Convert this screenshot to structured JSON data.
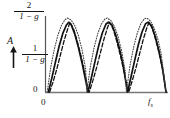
{
  "chart_data": {
    "type": "line",
    "title": "",
    "xlabel": "f",
    "ylabel": "A",
    "xlim": [
      0,
      1
    ],
    "ylim": [
      0,
      2
    ],
    "grid": false,
    "legend": "none",
    "x_tick_labels": [
      "0",
      "fs"
    ],
    "x_tick_values": [
      0,
      1
    ],
    "y_tick_labels": [
      "0",
      "1/(1-g)",
      "2/(1-g)"
    ],
    "y_tick_values": [
      0,
      1,
      2
    ],
    "annotations": [
      "A"
    ],
    "series": [
      {
        "name": "solid",
        "style": "solid",
        "color": "#111111",
        "peaks_x": [
          0.19,
          0.52,
          0.85
        ],
        "peak_value": 2.0,
        "zeros_x": [
          0.02,
          0.35,
          0.68,
          1.0
        ],
        "x": [
          0.02,
          0.05,
          0.08,
          0.11,
          0.14,
          0.17,
          0.19,
          0.21,
          0.24,
          0.27,
          0.3,
          0.33,
          0.35,
          0.38,
          0.41,
          0.44,
          0.47,
          0.5,
          0.52,
          0.55,
          0.58,
          0.61,
          0.64,
          0.67,
          0.68,
          0.71,
          0.74,
          0.77,
          0.8,
          0.83,
          0.85,
          0.88,
          0.91,
          0.94,
          0.97,
          1.0
        ],
        "y": [
          0.0,
          0.42,
          0.88,
          1.32,
          1.68,
          1.92,
          2.0,
          1.93,
          1.66,
          1.28,
          0.84,
          0.34,
          0.0,
          0.44,
          0.9,
          1.34,
          1.7,
          1.95,
          2.0,
          1.92,
          1.65,
          1.27,
          0.82,
          0.2,
          0.0,
          0.46,
          0.92,
          1.36,
          1.72,
          1.96,
          2.0,
          1.9,
          1.6,
          1.2,
          0.7,
          0.0
        ]
      },
      {
        "name": "dashed",
        "style": "dashed",
        "color": "#111111",
        "peaks_x": [
          0.2,
          0.53,
          0.86
        ],
        "peak_value": 2.0,
        "zeros_x": [
          0.03,
          0.36,
          0.69,
          1.0
        ],
        "x": [
          0.03,
          0.06,
          0.09,
          0.12,
          0.15,
          0.18,
          0.2,
          0.23,
          0.26,
          0.29,
          0.32,
          0.35,
          0.36,
          0.39,
          0.42,
          0.45,
          0.48,
          0.51,
          0.53,
          0.56,
          0.59,
          0.62,
          0.65,
          0.68,
          0.69,
          0.72,
          0.75,
          0.78,
          0.81,
          0.84,
          0.86,
          0.89,
          0.92,
          0.95,
          0.98,
          1.0
        ],
        "y": [
          0.0,
          0.3,
          0.66,
          1.06,
          1.46,
          1.8,
          2.0,
          1.8,
          1.46,
          1.06,
          0.6,
          0.1,
          0.0,
          0.32,
          0.68,
          1.08,
          1.48,
          1.82,
          2.0,
          1.8,
          1.45,
          1.05,
          0.58,
          0.08,
          0.0,
          0.34,
          0.7,
          1.1,
          1.5,
          1.84,
          2.0,
          1.78,
          1.42,
          1.0,
          0.5,
          0.0
        ]
      },
      {
        "name": "dotted",
        "style": "dotted",
        "color": "#444444",
        "peaks_x": [
          0.18,
          0.51,
          0.84
        ],
        "peak_value": 2.12,
        "zeros_x": [
          0.01,
          0.34,
          0.67,
          1.0
        ],
        "x": [
          0.01,
          0.04,
          0.07,
          0.1,
          0.13,
          0.16,
          0.18,
          0.21,
          0.24,
          0.27,
          0.3,
          0.33,
          0.34,
          0.37,
          0.4,
          0.43,
          0.46,
          0.49,
          0.51,
          0.54,
          0.57,
          0.6,
          0.63,
          0.66,
          0.67,
          0.7,
          0.73,
          0.76,
          0.79,
          0.82,
          0.84,
          0.87,
          0.9,
          0.93,
          0.96,
          1.0
        ],
        "y": [
          0.0,
          0.72,
          1.24,
          1.64,
          1.92,
          2.08,
          2.12,
          2.06,
          1.9,
          1.62,
          1.22,
          0.66,
          0.0,
          0.74,
          1.26,
          1.66,
          1.94,
          2.09,
          2.12,
          2.05,
          1.88,
          1.6,
          1.18,
          0.6,
          0.0,
          0.76,
          1.28,
          1.68,
          1.96,
          2.1,
          2.12,
          2.04,
          1.84,
          1.54,
          1.1,
          0.0
        ]
      }
    ]
  },
  "labels": {
    "y_top_numerator": "2",
    "y_top_denominator_pre": "1 − ",
    "y_top_denominator_var": "g",
    "y_mid_numerator": "1",
    "y_mid_denominator_pre": "1 − ",
    "y_mid_denominator_var": "g",
    "y_zero": "0",
    "x_zero": "0",
    "x_max": "f",
    "x_max_sub": "s",
    "amplitude_axis": "A"
  },
  "colors": {
    "background": "#ffffff",
    "ink": "#141414",
    "curve_solid": "#111111",
    "curve_dashed": "#111111",
    "curve_dotted": "#555555",
    "axis": "#555555"
  }
}
